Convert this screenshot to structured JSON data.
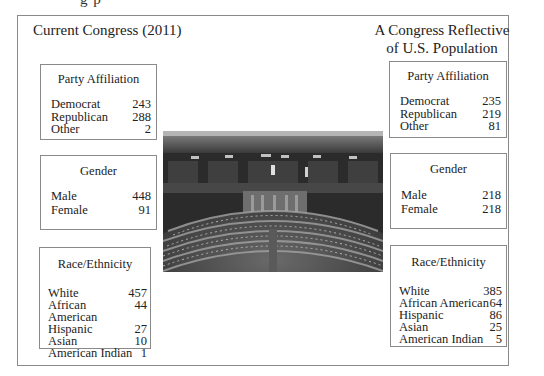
{
  "page": {
    "top_cut_text": "g  p"
  },
  "current": {
    "heading": "Current Congress (2011)",
    "party": {
      "title": "Party Affiliation",
      "rows": [
        {
          "label": "Democrat",
          "value": "243"
        },
        {
          "label": "Republican",
          "value": "288"
        },
        {
          "label": "Other",
          "value": "2"
        }
      ]
    },
    "gender": {
      "title": "Gender",
      "rows": [
        {
          "label": "Male",
          "value": "448"
        },
        {
          "label": "Female",
          "value": "91"
        }
      ]
    },
    "race": {
      "title": "Race/Ethnicity",
      "rows": [
        {
          "label": "White",
          "value": "457"
        },
        {
          "label": "African American",
          "value": "44"
        },
        {
          "label": "Hispanic",
          "value": "27"
        },
        {
          "label": "Asian",
          "value": "10"
        },
        {
          "label": "American Indian",
          "value": "1"
        }
      ]
    }
  },
  "reflective": {
    "heading_line1": "A Congress Reflective",
    "heading_line2": "of U.S. Population",
    "party": {
      "title": "Party Affiliation",
      "rows": [
        {
          "label": "Democrat",
          "value": "235"
        },
        {
          "label": "Republican",
          "value": "219"
        },
        {
          "label": "Other",
          "value": "81"
        }
      ]
    },
    "gender": {
      "title": "Gender",
      "rows": [
        {
          "label": "Male",
          "value": "218"
        },
        {
          "label": "Female",
          "value": "218"
        }
      ]
    },
    "race": {
      "title": "Race/Ethnicity",
      "rows": [
        {
          "label": "White",
          "value": "385"
        },
        {
          "label": "African American",
          "value": "64"
        },
        {
          "label": "Hispanic",
          "value": "86"
        },
        {
          "label": "Asian",
          "value": "25"
        },
        {
          "label": "American Indian",
          "value": "5"
        }
      ]
    }
  },
  "photo": {
    "subject": "house-chamber-photo"
  }
}
